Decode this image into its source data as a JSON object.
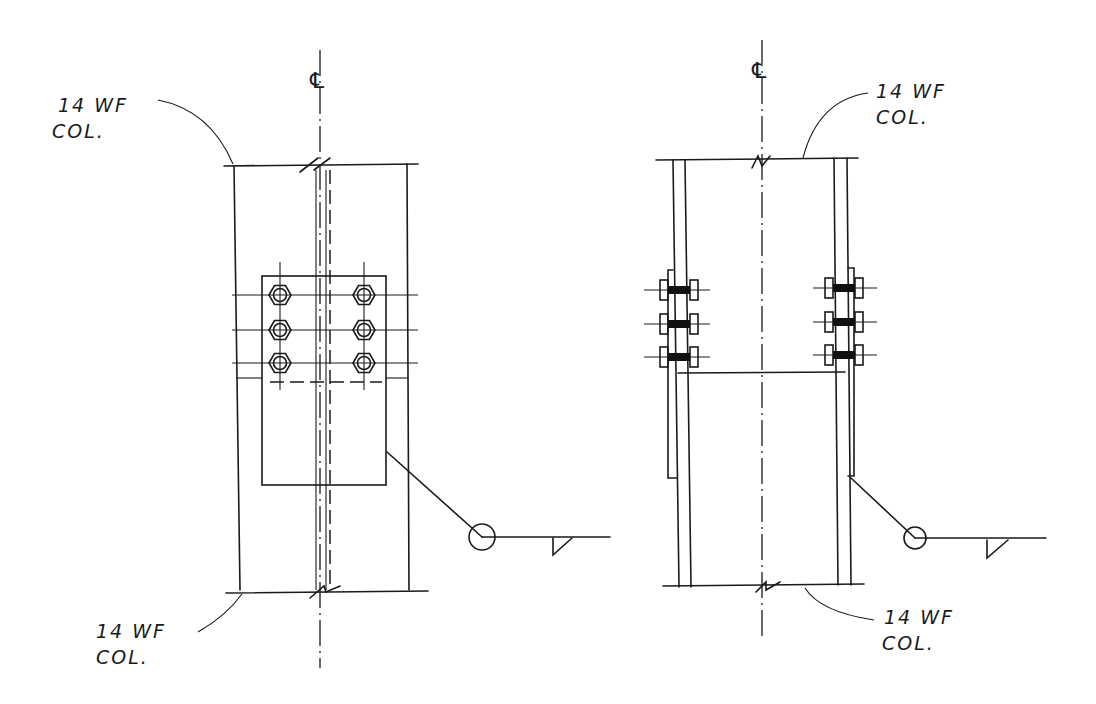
{
  "drawing": {
    "type": "column splice detail",
    "left_view": {
      "centerline_symbol": "℄",
      "top_label": {
        "line1": "14 WF",
        "line2": "COL."
      },
      "bottom_label": {
        "line1": "14 WF",
        "line2": "COL."
      },
      "bolt_rows": 3,
      "bolt_columns": 2,
      "weld_symbol": "field weld, fillet"
    },
    "right_view": {
      "centerline_symbol": "℄",
      "top_label": {
        "line1": "14 WF",
        "line2": "COL."
      },
      "bottom_label": {
        "line1": "14 WF",
        "line2": "COL."
      },
      "bolts_per_side": 3,
      "weld_symbol": "field weld, fillet"
    },
    "colors": {
      "ink": "#1a1a1a",
      "paper": "#ffffff"
    }
  }
}
